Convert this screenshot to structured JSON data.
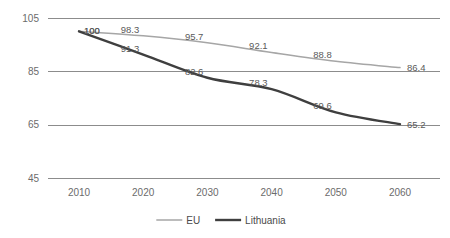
{
  "chart_data": {
    "type": "line",
    "title": "",
    "subtitle": "",
    "xlabel": "",
    "ylabel": "",
    "categories": [
      "2010",
      "2020",
      "2030",
      "2040",
      "2050",
      "2060"
    ],
    "x": [
      2010,
      2020,
      2030,
      2040,
      2050,
      2060
    ],
    "ylim": [
      45,
      105
    ],
    "yticks": [
      "105",
      "85",
      "65",
      "45"
    ],
    "ytick_values": [
      105,
      85,
      65,
      45
    ],
    "grid": true,
    "grid_axis": "y",
    "legend_position": "bottom",
    "smoothing": "spline",
    "series": [
      {
        "name": "EU",
        "color": "#a6a6a6",
        "width": 1.5,
        "values": [
          100,
          98.3,
          95.7,
          92.1,
          88.8,
          86.4
        ],
        "labels": [
          "100",
          "98.3",
          "95.7",
          "92.1",
          "88.8",
          "86.4"
        ]
      },
      {
        "name": "Lithuania",
        "color": "#3f3f3f",
        "width": 2.4,
        "values": [
          100,
          91.3,
          82.6,
          78.3,
          69.6,
          65.2
        ],
        "labels": [
          "100",
          "91.3",
          "82.6",
          "78.3",
          "69.6",
          "65.2"
        ]
      }
    ]
  },
  "legend": {
    "items": [
      {
        "label": "EU",
        "color": "#a6a6a6",
        "width": 1.5
      },
      {
        "label": "Lithuania",
        "color": "#3f3f3f",
        "width": 2.4
      }
    ]
  },
  "axes": {
    "y": {
      "ticks": [
        "105",
        "85",
        "65",
        "45"
      ]
    },
    "x": {
      "ticks": [
        "2010",
        "2020",
        "2030",
        "2040",
        "2050",
        "2060"
      ]
    }
  },
  "colors": {
    "gridline": "#8c8c8c",
    "axis_text": "#6b6b6b",
    "label_text": "#5a5a5a",
    "background": "#ffffff"
  }
}
